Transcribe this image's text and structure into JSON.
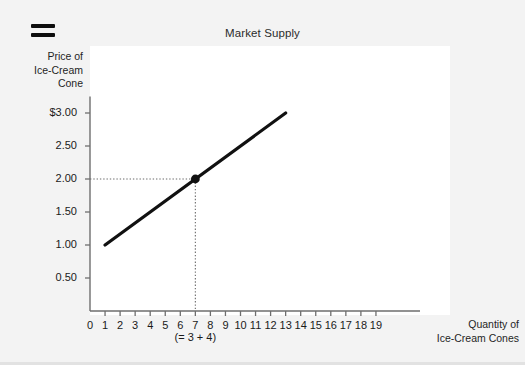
{
  "header": {
    "menu_icon": "hamburger-icon",
    "title": "Market Supply"
  },
  "chart_data": {
    "type": "line",
    "title": "Market Supply",
    "xlabel": "Quantity of Ice-Cream Cones",
    "ylabel": "Price of Ice-Cream Cone",
    "xlabel_lines": [
      "Quantity of",
      "Ice-Cream Cones"
    ],
    "ylabel_lines": [
      "Price of",
      "Ice-Cream",
      "Cone"
    ],
    "xlim": [
      0,
      19
    ],
    "ylim": [
      0,
      3.25
    ],
    "grid": false,
    "legend": null,
    "x_tick_labels": [
      "0",
      "1",
      "2",
      "3",
      "4",
      "5",
      "6",
      "7",
      "8",
      "9",
      "10",
      "11",
      "12",
      "13",
      "14",
      "15",
      "16",
      "17",
      "18",
      "19"
    ],
    "x_tick_values": [
      0,
      1,
      2,
      3,
      4,
      5,
      6,
      7,
      8,
      9,
      10,
      11,
      12,
      13,
      14,
      15,
      16,
      17,
      18,
      19
    ],
    "y_tick_labels": [
      "$3.00",
      "2.50",
      "2.00",
      "1.50",
      "1.00",
      "0.50"
    ],
    "y_tick_values": [
      3.0,
      2.5,
      2.0,
      1.5,
      1.0,
      0.5
    ],
    "series": [
      {
        "name": "Supply",
        "type": "line",
        "color": "#111111",
        "points": [
          {
            "x": 1,
            "y": 1.0
          },
          {
            "x": 13,
            "y": 3.0
          }
        ]
      }
    ],
    "markers": [
      {
        "name": "supply-point",
        "x": 7,
        "y": 2.0,
        "color": "#111111",
        "guides": "dotted"
      }
    ],
    "annotations": [
      {
        "name": "quantity-sum-note",
        "text": "(= 3 + 4)",
        "x": 7,
        "position": "below-x-axis"
      }
    ]
  }
}
